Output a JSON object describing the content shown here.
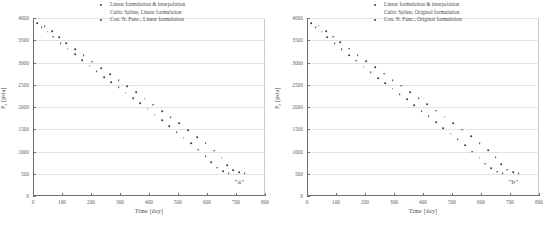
{
  "figure": {
    "panels": [
      {
        "id": "a",
        "annotation": "\"a\"",
        "xlabel": "Time [day]",
        "ylabel_text": "P",
        "ylabel_sub": "r",
        "ylabel_unit": " [psia]",
        "legend": [
          "Linear formulation & interpolation",
          "Cubic Spline, Linear formulation",
          "Con. N. Func., Linear formulation"
        ],
        "legend_marker": [
          true,
          false,
          true
        ]
      },
      {
        "id": "b",
        "annotation": "\"b\"",
        "xlabel": "Time [day]",
        "ylabel_text": "P",
        "ylabel_sub": "r",
        "ylabel_unit": " [psia]",
        "legend": [
          "Linear formulation & interpolation",
          "Cubic Spline, Original formulation",
          "Con. N. Func., Original formulation"
        ],
        "legend_marker": [
          true,
          false,
          true
        ]
      }
    ]
  },
  "chart_data": [
    {
      "type": "scatter",
      "title": "",
      "panel_label": "\"a\"",
      "xlabel": "Time [day]",
      "ylabel": "P_r [psia]",
      "xlim": [
        0,
        800
      ],
      "ylim": [
        0,
        4000
      ],
      "xticks": [
        0,
        100,
        200,
        300,
        400,
        500,
        600,
        700,
        800
      ],
      "yticks": [
        0,
        500,
        1000,
        1500,
        2000,
        2500,
        3000,
        3500,
        4000
      ],
      "grid": "horizontal",
      "legend_position": "top-right",
      "legend": [
        "Linear formulation & interpolation",
        "Cubic Spline, Linear formulation",
        "Con. N. Func., Linear formulation"
      ],
      "series": [
        {
          "name": "Cubic Spline, Linear formulation",
          "x": [
            15,
            30,
            50,
            70,
            95,
            120,
            145,
            170,
            195,
            220,
            245,
            270,
            295,
            320,
            345,
            370,
            395,
            420,
            445,
            470,
            495,
            520,
            545,
            570,
            595,
            615,
            635,
            655,
            675
          ],
          "y": [
            3880,
            3800,
            3690,
            3580,
            3440,
            3310,
            3180,
            3060,
            2930,
            2800,
            2670,
            2560,
            2440,
            2320,
            2200,
            2080,
            1960,
            1830,
            1700,
            1570,
            1440,
            1310,
            1180,
            1040,
            900,
            760,
            640,
            560,
            520
          ]
        },
        {
          "name": "Con. N. Func., Linear formulation",
          "x": [
            40,
            65,
            90,
            115,
            145,
            175,
            205,
            235,
            265,
            295,
            325,
            355,
            385,
            415,
            445,
            475,
            505,
            535,
            565,
            595,
            625,
            650,
            670,
            690,
            710,
            730
          ],
          "y": [
            3820,
            3700,
            3570,
            3440,
            3300,
            3160,
            3020,
            2880,
            2740,
            2600,
            2470,
            2330,
            2190,
            2050,
            1910,
            1770,
            1630,
            1480,
            1330,
            1180,
            1020,
            860,
            700,
            580,
            540,
            520
          ]
        }
      ]
    },
    {
      "type": "scatter",
      "title": "",
      "panel_label": "\"b\"",
      "xlabel": "Time [day]",
      "ylabel": "P_r [psia]",
      "xlim": [
        0,
        800
      ],
      "ylim": [
        0,
        4000
      ],
      "xticks": [
        0,
        100,
        200,
        300,
        400,
        500,
        600,
        700,
        800
      ],
      "yticks": [
        0,
        500,
        1000,
        1500,
        2000,
        2500,
        3000,
        3500,
        4000
      ],
      "grid": "horizontal",
      "legend_position": "top-right",
      "legend": [
        "Linear formulation & interpolation",
        "Cubic Spline, Original formulation",
        "Con. N. Func., Original formulation"
      ],
      "series": [
        {
          "name": "Cubic Spline, Original formulation",
          "x": [
            15,
            30,
            50,
            70,
            95,
            120,
            145,
            170,
            195,
            220,
            245,
            270,
            295,
            320,
            345,
            370,
            395,
            420,
            445,
            470,
            495,
            520,
            545,
            570,
            595,
            615,
            635,
            655,
            675
          ],
          "y": [
            3880,
            3800,
            3690,
            3570,
            3430,
            3300,
            3170,
            3040,
            2910,
            2780,
            2650,
            2530,
            2410,
            2290,
            2170,
            2040,
            1910,
            1790,
            1660,
            1530,
            1400,
            1270,
            1140,
            1000,
            860,
            730,
            620,
            550,
            510
          ]
        },
        {
          "name": "Con. N. Func., Original formulation",
          "x": [
            40,
            65,
            90,
            115,
            145,
            175,
            205,
            235,
            265,
            295,
            325,
            355,
            385,
            415,
            445,
            475,
            505,
            535,
            565,
            595,
            625,
            650,
            670,
            690,
            710,
            730
          ],
          "y": [
            3830,
            3710,
            3580,
            3450,
            3310,
            3170,
            3030,
            2890,
            2750,
            2610,
            2480,
            2340,
            2200,
            2060,
            1920,
            1780,
            1640,
            1490,
            1340,
            1190,
            1030,
            870,
            710,
            590,
            540,
            515
          ]
        }
      ]
    }
  ]
}
